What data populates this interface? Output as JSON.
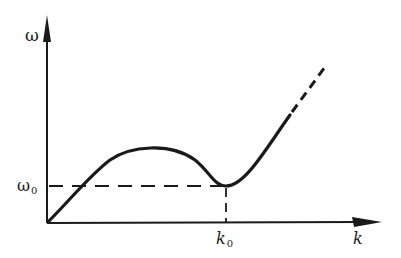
{
  "diagram": {
    "type": "dispersion-relation",
    "y_axis": {
      "label": "ω"
    },
    "x_axis": {
      "label": "k"
    },
    "markers": {
      "omega0": {
        "symbol": "ω",
        "subscript": "0"
      },
      "k0": {
        "symbol": "k",
        "subscript": "0"
      }
    },
    "colors": {
      "ink": "#1a1a1a",
      "background": "#ffffff"
    }
  }
}
